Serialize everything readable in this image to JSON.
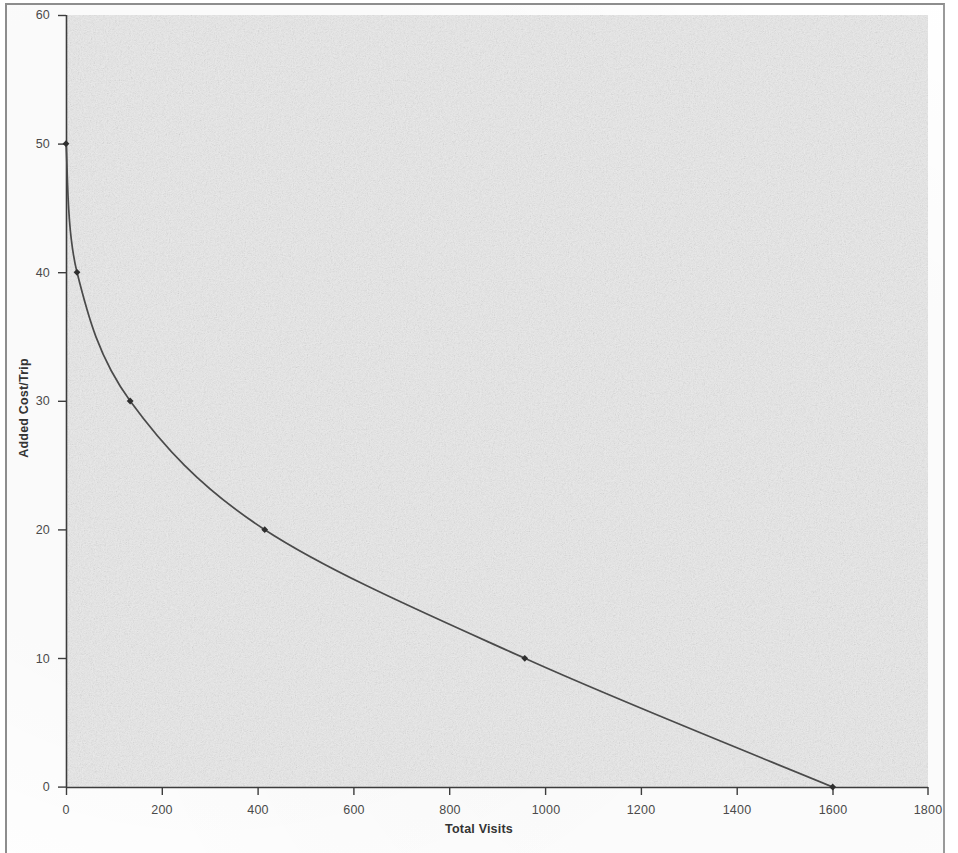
{
  "figure": {
    "kind": "scanned-chart",
    "background_color": "#ffffff",
    "plot_background_color": "#ececec",
    "axis_color": "#3c3c3c",
    "series_color": "#4a4a4a",
    "frame_color": "#8d8d8d"
  },
  "chart_data": {
    "type": "line",
    "title": "",
    "subtitle": "",
    "xlabel": "Total Visits",
    "ylabel": "Added Cost/Trip",
    "xlim": [
      0,
      1800
    ],
    "ylim": [
      0,
      60
    ],
    "xticks": [
      0,
      200,
      400,
      600,
      800,
      1000,
      1200,
      1400,
      1600,
      1800
    ],
    "yticks": [
      0,
      10,
      20,
      30,
      40,
      50,
      60
    ],
    "xtick_labels": [
      "0",
      "200",
      "400",
      "600",
      "800",
      "1000",
      "1200",
      "1400",
      "1600",
      "1800"
    ],
    "ytick_labels": [
      "0",
      "10",
      "20",
      "30",
      "40",
      "50",
      "60"
    ],
    "grid": false,
    "legend": null,
    "legend_position": "none",
    "marker": "diamond",
    "series": [
      {
        "name": "Added Cost/Trip vs Total Visits",
        "x": [
          0,
          23,
          134,
          415,
          958,
          1601
        ],
        "y": [
          50,
          40,
          30,
          20,
          10,
          0
        ],
        "marker_points": [
          {
            "x": 0,
            "y": 50
          },
          {
            "x": 23,
            "y": 40
          },
          {
            "x": 134,
            "y": 30
          },
          {
            "x": 415,
            "y": 20
          },
          {
            "x": 958,
            "y": 10
          },
          {
            "x": 1601,
            "y": 0
          }
        ]
      }
    ],
    "annotations": []
  }
}
